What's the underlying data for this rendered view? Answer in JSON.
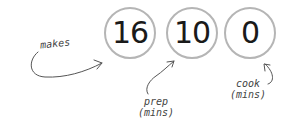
{
  "stats": [
    {
      "id": "makes",
      "value": "16",
      "label": "makes"
    },
    {
      "id": "prep",
      "value": "10",
      "label_line1": "prep",
      "label_line2": "(mins)"
    },
    {
      "id": "cook",
      "value": "0",
      "label_line1": "cook",
      "label_line2": "(mins)"
    }
  ],
  "colors": {
    "circle_border": "#b5b5b5",
    "number": "#1a1a1a",
    "annotation": "#555555"
  }
}
